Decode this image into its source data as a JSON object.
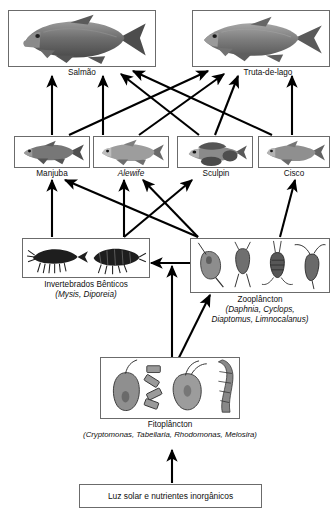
{
  "diagram": {
    "language": "pt-BR",
    "background": "#ffffff",
    "line_color": "#000000",
    "box_border_color": "#6b6b6b"
  },
  "nodes": {
    "salmon": {
      "label": "Salmão",
      "italic": false,
      "icon": "salmon-fish-illustration",
      "tier": 1
    },
    "lake_trout": {
      "label": "Truta-de-lago",
      "italic": false,
      "icon": "lake-trout-fish-illustration",
      "tier": 1
    },
    "smelt": {
      "label": "Manjuba",
      "italic": false,
      "icon": "smelt-fish-illustration",
      "tier": 2
    },
    "alewife": {
      "label": "Alewife",
      "italic": true,
      "icon": "alewife-fish-illustration",
      "tier": 2
    },
    "sculpin": {
      "label": "Sculpin",
      "italic": false,
      "icon": "sculpin-fish-illustration",
      "tier": 2
    },
    "cisco": {
      "label": "Cisco",
      "italic": false,
      "icon": "cisco-fish-illustration",
      "tier": 2
    },
    "benthic": {
      "label": "Invertebrados Bênticos",
      "species": "(Mysis, Diporeia)",
      "icon": "benthic-invertebrates-illustration",
      "tier": 3
    },
    "zooplankton": {
      "label": "Zooplâncton",
      "species_line1": "(Daphnia, Cyclops,",
      "species_line2": "Diaptomus, Limnocalanus)",
      "icon": "zooplankton-illustration",
      "tier": 3
    },
    "phytoplankton": {
      "label": "Fitoplâncton",
      "species": "(Cryptomonas, Tabellaria, Rhodomonas, Melosira)",
      "icon": "phytoplankton-illustration",
      "tier": 4
    },
    "sunlight": {
      "label": "Luz solar e nutrientes inorgânicos",
      "tier": 5
    }
  },
  "edges": [
    {
      "from": "smelt",
      "to": "salmon"
    },
    {
      "from": "alewife",
      "to": "salmon"
    },
    {
      "from": "sculpin",
      "to": "salmon"
    },
    {
      "from": "cisco",
      "to": "salmon"
    },
    {
      "from": "smelt",
      "to": "lake_trout"
    },
    {
      "from": "alewife",
      "to": "lake_trout"
    },
    {
      "from": "sculpin",
      "to": "lake_trout"
    },
    {
      "from": "cisco",
      "to": "lake_trout"
    },
    {
      "from": "benthic",
      "to": "smelt"
    },
    {
      "from": "benthic",
      "to": "alewife"
    },
    {
      "from": "benthic",
      "to": "sculpin"
    },
    {
      "from": "zooplankton",
      "to": "smelt"
    },
    {
      "from": "zooplankton",
      "to": "alewife"
    },
    {
      "from": "zooplankton",
      "to": "cisco"
    },
    {
      "from": "zooplankton",
      "to": "benthic"
    },
    {
      "from": "phytoplankton",
      "to": "zooplankton"
    },
    {
      "from": "phytoplankton",
      "to": "benthic"
    },
    {
      "from": "sunlight",
      "to": "phytoplankton"
    }
  ]
}
